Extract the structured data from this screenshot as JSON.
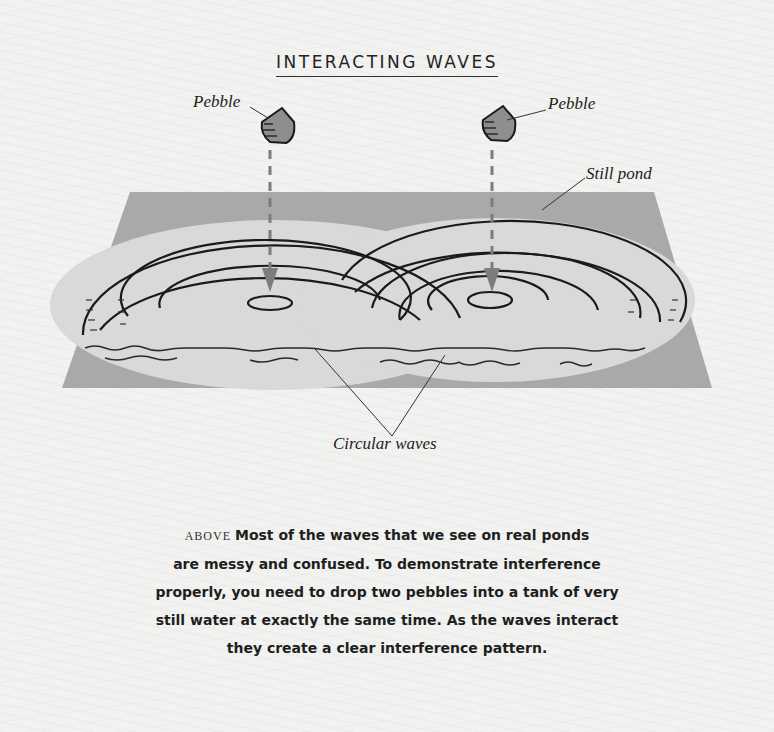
{
  "title": "INTERACTING WAVES",
  "labels": {
    "pebble_left": "Pebble",
    "pebble_right": "Pebble",
    "still_pond": "Still pond",
    "circular_waves": "Circular waves"
  },
  "caption": {
    "lead": "ABOVE",
    "lines": [
      "Most of the waves that we see on real ponds",
      "are messy and confused. To demonstrate interference",
      "properly, you need to drop two pebbles into a tank of very",
      "still water at exactly the same time. As the waves interact",
      "they create a clear interference pattern."
    ]
  },
  "colors": {
    "pond": "#a9a9a7",
    "wave_area": "#d8d8d6",
    "arrow": "#7d7d7d",
    "ink": "#1a1a1a",
    "paper": "#f2f2f0"
  },
  "icons": {
    "pebble": "pebble-icon",
    "arrow": "down-arrow-icon"
  }
}
